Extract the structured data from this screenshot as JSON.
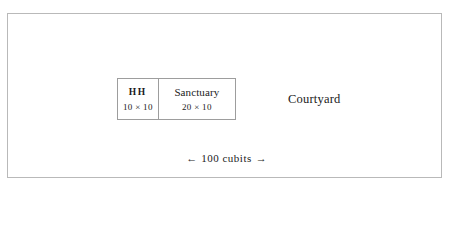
{
  "diagram": {
    "title_text": "",
    "precinct": {
      "name": "precinct-frame",
      "border_color": "#b9b9b9",
      "background": "#ffffff"
    },
    "building": {
      "border_color": "#9d9d9d",
      "rooms": [
        {
          "id": "holy-of-holies",
          "label": "HH",
          "dimensions": "10 × 10"
        },
        {
          "id": "sanctuary",
          "label": "Sanctuary",
          "dimensions": "20 × 10"
        }
      ]
    },
    "courtyard": {
      "label": "Courtyard"
    },
    "scale": {
      "left_arrow": "←",
      "value": "100 cubits",
      "right_arrow": "→",
      "full_text": "← 100 cubits →"
    },
    "colors": {
      "text": "#1a1a1a",
      "outer_border": "#b9b9b9",
      "inner_border": "#9d9d9d",
      "background": "#ffffff"
    }
  }
}
